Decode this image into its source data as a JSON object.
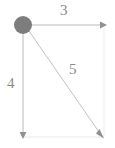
{
  "diagram": {
    "type": "right-triangle-vector-diagram",
    "title": "",
    "canvas": {
      "width": 115,
      "height": 148,
      "background": "#ffffff"
    },
    "colors": {
      "vertex_dot": "#7d7d7d",
      "solid_line": "#b5b5b5",
      "faint_line": "#e8e8e8",
      "arrowhead": "#8f8f8f",
      "label_text": "#8a8a8a"
    },
    "vertices": {
      "origin": {
        "name": "origin-vertex",
        "x": 23,
        "y": 25,
        "marker": "filled-circle",
        "radius": 9
      },
      "top_right": {
        "name": "top-right-vertex",
        "x": 104,
        "y": 25
      },
      "bottom_left": {
        "name": "bottom-left-vertex",
        "x": 23,
        "y": 137
      },
      "bottom_right": {
        "name": "bottom-right-vertex",
        "x": 104,
        "y": 137
      }
    },
    "edges": [
      {
        "id": "horizontal",
        "name": "horizontal-vector",
        "label": "3",
        "from": "origin",
        "to": "top_right",
        "style": "solid",
        "arrowhead": "right"
      },
      {
        "id": "vertical",
        "name": "vertical-vector",
        "label": "4",
        "from": "origin",
        "to": "bottom_left",
        "style": "solid",
        "arrowhead": "down"
      },
      {
        "id": "diagonal",
        "name": "diagonal-vector",
        "label": "5",
        "from": "origin",
        "to": "bottom_right",
        "style": "solid",
        "arrowhead": "down-right"
      },
      {
        "id": "bottom-guide",
        "name": "bottom-guide-line",
        "label": "",
        "from": "bottom_left",
        "to": "bottom_right",
        "style": "faint",
        "arrowhead": "none"
      },
      {
        "id": "right-guide",
        "name": "right-guide-line",
        "label": "",
        "from": "top_right",
        "to": "bottom_right",
        "style": "faint",
        "arrowhead": "none"
      }
    ],
    "labels": {
      "horizontal": "3",
      "vertical": "4",
      "diagonal": "5"
    }
  }
}
